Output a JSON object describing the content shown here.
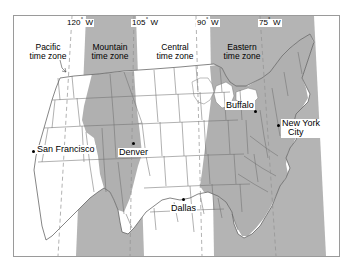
{
  "figure": {
    "background_color": "#ffffff",
    "frame_color": "#9a9a9a",
    "shaded_zone_color": "#a8a8a8",
    "unshaded_zone_color": "#ffffff",
    "state_border_color": "#6a6a6a",
    "meridian_line_color": "#8a8a8a",
    "meridian_line_style": "dashed"
  },
  "meridians": [
    {
      "label": "120",
      "unit": "°",
      "hemisphere": "W",
      "x": 78
    },
    {
      "label": "105",
      "unit": "°",
      "hemisphere": "W",
      "x": 135
    },
    {
      "label": "90",
      "unit": "°",
      "hemisphere": "W",
      "x": 196
    },
    {
      "label": "75",
      "unit": "°",
      "hemisphere": "W",
      "x": 262
    }
  ],
  "time_zones": [
    {
      "name": "Pacific",
      "line1": "Pacific",
      "line2": "time zone",
      "shaded": false
    },
    {
      "name": "Mountain",
      "line1": "Mountain",
      "line2": "time zone",
      "shaded": true
    },
    {
      "name": "Central",
      "line1": "Central",
      "line2": "time zone",
      "shaded": false
    },
    {
      "name": "Eastern",
      "line1": "Eastern",
      "line2": "time zone",
      "shaded": true
    }
  ],
  "cities": [
    {
      "name": "San Francisco",
      "line1": "San Francisco",
      "line2": "",
      "zone": "Pacific"
    },
    {
      "name": "Denver",
      "line1": "Denver",
      "line2": "",
      "zone": "Mountain"
    },
    {
      "name": "Dallas",
      "line1": "Dallas",
      "line2": "",
      "zone": "Central"
    },
    {
      "name": "Buffalo",
      "line1": "Buffalo",
      "line2": "",
      "zone": "Eastern"
    },
    {
      "name": "New York City",
      "line1": "New York",
      "line2": "City",
      "zone": "Eastern"
    }
  ]
}
